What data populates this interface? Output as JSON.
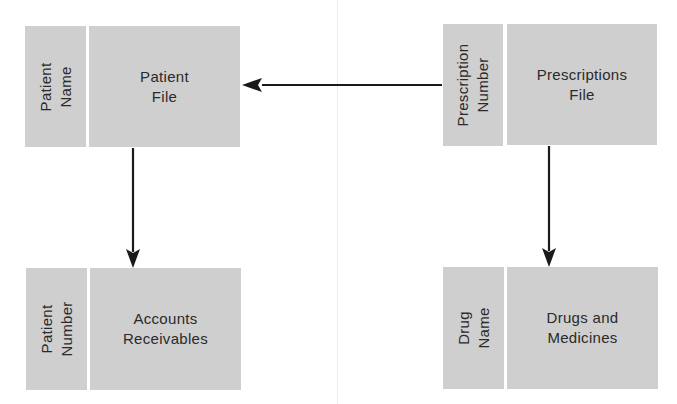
{
  "diagram": {
    "type": "file-relationship-diagram",
    "nodes": [
      {
        "id": "patient-file",
        "key": [
          "Patient",
          "Name"
        ],
        "title": [
          "Patient",
          "File"
        ]
      },
      {
        "id": "accounts-receivables",
        "key": [
          "Patient",
          "Number"
        ],
        "title": [
          "Accounts",
          "Receivables"
        ]
      },
      {
        "id": "prescriptions-file",
        "key": [
          "Prescription",
          "Number"
        ],
        "title": [
          "Prescriptions",
          "File"
        ]
      },
      {
        "id": "drugs-and-medicines",
        "key": [
          "Drug",
          "Name"
        ],
        "title": [
          "Drugs and",
          "Medicines"
        ]
      }
    ],
    "edges": [
      {
        "from": "prescriptions-file",
        "to": "patient-file",
        "direction": "left"
      },
      {
        "from": "patient-file",
        "to": "accounts-receivables",
        "direction": "down"
      },
      {
        "from": "prescriptions-file",
        "to": "drugs-and-medicines",
        "direction": "down"
      }
    ],
    "colors": {
      "box_fill": "#cfcfcf",
      "text": "#2a2a2a",
      "arrow": "#1a1a1a",
      "divider": "#ececec"
    }
  }
}
